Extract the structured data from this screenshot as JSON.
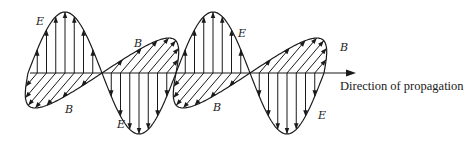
{
  "figure": {
    "labels": {
      "e_label": "E",
      "b_label": "B",
      "propagation_label": "Direction of propagation"
    },
    "colors": {
      "ink": "#1a1a1a",
      "background": "#ffffff"
    }
  },
  "chart_data": {
    "type": "diagram",
    "axis": {
      "y": 73,
      "x_start": 30,
      "x_end": 356
    },
    "e_wave": {
      "name": "E",
      "x0": 28,
      "wavelength": 148,
      "amplitude": 61,
      "cycles": 2.0,
      "phase": "starts rising (peak first)",
      "orientation": "vertical"
    },
    "b_wave": {
      "name": "B",
      "x0": 28,
      "wavelength": 148,
      "amplitude": 35,
      "slant": 0.85,
      "phase": "starts negative (down-left first)",
      "orientation": "oblique (perspective, perpendicular to E)"
    },
    "annotations": [
      {
        "text": "E",
        "x": 36,
        "y": 25
      },
      {
        "text": "B",
        "x": 65,
        "y": 113
      },
      {
        "text": "B",
        "x": 134,
        "y": 47
      },
      {
        "text": "E",
        "x": 117,
        "y": 128
      },
      {
        "text": "B",
        "x": 213,
        "y": 111
      },
      {
        "text": "E",
        "x": 238,
        "y": 37
      },
      {
        "text": "E",
        "x": 318,
        "y": 119
      },
      {
        "text": "B",
        "x": 340,
        "y": 51
      },
      {
        "text": "Direction of propagation",
        "x": 340,
        "y": 90
      }
    ]
  }
}
